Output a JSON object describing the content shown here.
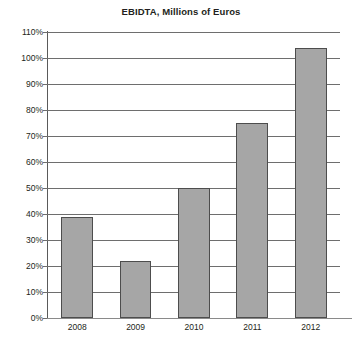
{
  "chart_data": {
    "type": "bar",
    "title": "EBIDTA, Millions of Euros",
    "xlabel": "",
    "ylabel": "",
    "categories": [
      "2008",
      "2009",
      "2010",
      "2011",
      "2012"
    ],
    "values": [
      39,
      22,
      50,
      75,
      104
    ],
    "value_labels": [
      "39%",
      "22%",
      "50%",
      "75%",
      "104%"
    ],
    "ylim": [
      0,
      110
    ],
    "ytick_step": 10,
    "ytick_labels": [
      "0%",
      "10%",
      "20%",
      "30%",
      "40%",
      "50%",
      "60%",
      "70%",
      "80%",
      "90%",
      "100%",
      "110%"
    ],
    "ytick_values": [
      0,
      10,
      20,
      30,
      40,
      50,
      60,
      70,
      80,
      90,
      100,
      110
    ],
    "grid": true,
    "legend": false,
    "series": [
      {
        "name": "EBIDTA",
        "values": [
          39,
          22,
          50,
          75,
          104
        ]
      }
    ],
    "colors": {
      "bar_fill": "#a6a6a6",
      "bar_border": "#4d4d4d",
      "gridline": "#6e6e6e",
      "axis": "#5a5a5a",
      "text": "#231f20",
      "background": "#ffffff"
    }
  }
}
